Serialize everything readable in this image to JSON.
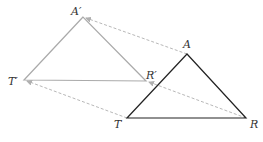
{
  "diagram": {
    "original": {
      "name": "triangle-TAR",
      "vertices": [
        {
          "id": "A",
          "label": "A"
        },
        {
          "id": "T",
          "label": "T"
        },
        {
          "id": "R",
          "label": "R"
        }
      ],
      "color": "#222222"
    },
    "image": {
      "name": "triangle-T'A'R'",
      "vertices": [
        {
          "id": "A'",
          "label": "A′"
        },
        {
          "id": "T'",
          "label": "T′"
        },
        {
          "id": "R'",
          "label": "R′"
        }
      ],
      "color": "#aaaaaa"
    },
    "translation_arrows": [
      {
        "from": "A",
        "to": "A'"
      },
      {
        "from": "T",
        "to": "T'"
      },
      {
        "from": "R",
        "to": "R'"
      }
    ],
    "arrow_color": "#b8b8b8"
  }
}
